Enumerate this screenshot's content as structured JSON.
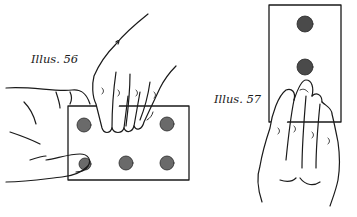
{
  "illustrations": [
    {
      "caption": "Illus. 56",
      "card": {
        "orientation": "landscape",
        "coins_visible": 5,
        "coins_total": 6
      },
      "description": "Left hand holds card, thumb covering lower-left coin; right hand fingertips rest on top edge"
    },
    {
      "caption": "Illus. 57",
      "card": {
        "orientation": "portrait",
        "coins_visible": 2
      },
      "description": "Right hand slid over lower half of upright card, two coins visible above fingers"
    }
  ],
  "colors": {
    "ink": "#1a1a1a",
    "coin": "#6a6a6a",
    "coin_dark": "#3a3a3a",
    "paper": "#ffffff"
  }
}
